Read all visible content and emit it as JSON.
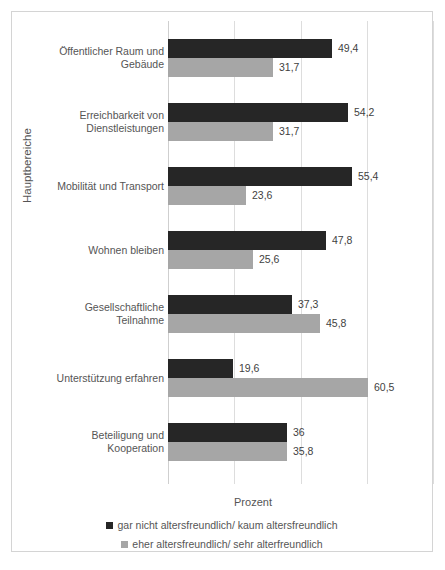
{
  "chart_data": {
    "type": "bar",
    "orientation": "horizontal",
    "title": "",
    "xlabel": "Prozent",
    "ylabel": "Hauptbereiche",
    "xlim": [
      0,
      80
    ],
    "xticks": [
      0,
      20,
      40,
      60,
      80
    ],
    "grid": true,
    "legend_position": "bottom",
    "categories": [
      "Öffentlicher Raum und Gebäude",
      "Erreichbarkeit von Dienstleistungen",
      "Mobilität und Transport",
      "Wohnen bleiben",
      "Gesellschaftliche Teilnahme",
      "Unterstützung erfahren",
      "Beteiligung und Kooperation"
    ],
    "series": [
      {
        "name": "gar nicht altersfreundlich/ kaum altersfreundlich",
        "color": "#262626",
        "values": [
          49.4,
          54.2,
          55.4,
          47.8,
          37.3,
          19.6,
          36
        ],
        "labels": [
          "49,4",
          "54,2",
          "55,4",
          "47,8",
          "37,3",
          "19,6",
          "36"
        ]
      },
      {
        "name": "eher altersfreundlich/ sehr alterfreundlich",
        "color": "#a6a6a6",
        "values": [
          31.7,
          31.7,
          23.6,
          25.6,
          45.8,
          60.5,
          35.8
        ],
        "labels": [
          "31,7",
          "31,7",
          "23,6",
          "25,6",
          "45,8",
          "60,5",
          "35,8"
        ]
      }
    ]
  },
  "caption": {
    "text": ""
  }
}
